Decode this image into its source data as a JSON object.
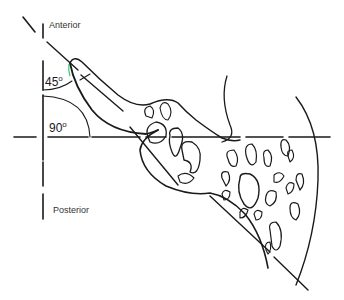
{
  "diagram": {
    "labels": {
      "anterior": "Anterior",
      "posterior": "Posterior",
      "angle_small": "45",
      "angle_large": "90",
      "degree_symbol": "o"
    },
    "axes": {
      "vertical": "anterior-posterior reference line",
      "horizontal": "horizontal reference line",
      "oblique": "oblique line at 45 degrees"
    },
    "colors": {
      "ink": "#1a1a1a",
      "text": "#333333",
      "accent_mark": "#2ecc71",
      "background": "#ffffff"
    }
  }
}
